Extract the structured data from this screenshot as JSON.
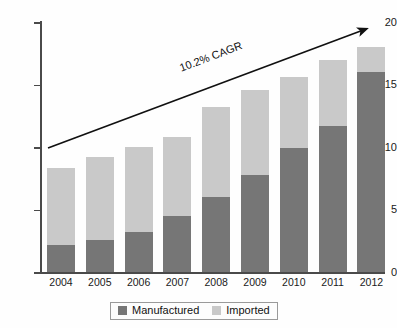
{
  "chart_data": {
    "type": "bar",
    "stacked": true,
    "title": "",
    "subtitle": "",
    "xlabel": "",
    "ylabel": "",
    "categories": [
      "2004",
      "2005",
      "2006",
      "2007",
      "2008",
      "2009",
      "2010",
      "2011",
      "2012"
    ],
    "series": [
      {
        "name": "Manufactured",
        "color": "#767676",
        "values": [
          2.2,
          2.6,
          3.2,
          4.5,
          6.0,
          7.8,
          9.9,
          11.7,
          16.0
        ]
      },
      {
        "name": "Imported",
        "color": "#c9c9c9",
        "values": [
          6.1,
          6.6,
          6.8,
          6.3,
          7.2,
          6.8,
          5.7,
          5.3,
          2.0
        ]
      }
    ],
    "totals": [
      8.3,
      9.2,
      10.0,
      10.8,
      13.2,
      14.6,
      15.6,
      17.0,
      18.0
    ],
    "ylim": [
      0,
      20
    ],
    "yticks": [
      "0",
      "5",
      "10",
      "15",
      "20"
    ],
    "ytick_values": [
      0,
      5,
      10,
      15,
      20
    ],
    "grid": false,
    "legend_position": "bottom",
    "annotations": [
      {
        "text": "10.2% CAGR",
        "type": "trend-arrow",
        "from": [
          2004,
          9.0
        ],
        "to": [
          2012,
          19.6
        ]
      }
    ]
  },
  "axes": {
    "y_ticks": [
      {
        "label": "20",
        "value": 20
      },
      {
        "label": "15",
        "value": 15
      },
      {
        "label": "10",
        "value": 10
      },
      {
        "label": "5",
        "value": 5
      },
      {
        "label": "0",
        "value": 0
      }
    ],
    "x_ticks": [
      "2004",
      "2005",
      "2006",
      "2007",
      "2008",
      "2009",
      "2010",
      "2011",
      "2012"
    ]
  },
  "annotation": {
    "cagr_label": "10.2% CAGR"
  },
  "legend": {
    "items": [
      {
        "label": "Manufactured",
        "color": "#767676"
      },
      {
        "label": "Imported",
        "color": "#c9c9c9"
      }
    ]
  },
  "colors": {
    "manufactured": "#767676",
    "imported": "#c9c9c9",
    "axis": "#4a4a4a",
    "arrow": "#111111",
    "background": "#fefefe"
  }
}
